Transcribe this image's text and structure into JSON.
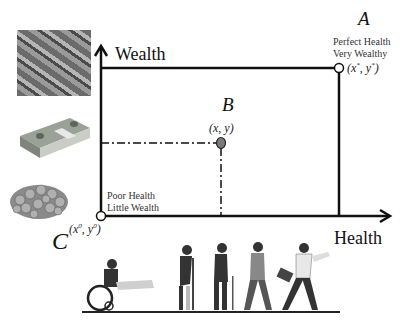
{
  "axes": {
    "y_label": "Wealth",
    "x_label": "Health"
  },
  "points": {
    "A": {
      "name": "A",
      "desc_line1": "Perfect Health",
      "desc_line2": "Very Wealthy",
      "coord": "(x*, y*)"
    },
    "B": {
      "name": "B",
      "coord": "(x, y)"
    },
    "C": {
      "name": "C",
      "desc_line1": "Poor Health",
      "desc_line2": "Little Wealth",
      "coord": "(x0, y0)"
    }
  },
  "images": {
    "top": "pile-of-cash",
    "middle": "stack-of-banknotes",
    "bottom": "pile-of-coins",
    "bottom_strip": "progression-from-wheelchair-to-running-businessman"
  },
  "colors": {
    "line": "#111111",
    "point_b_fill": "#7a7a7a",
    "open_point_fill": "#ffffff"
  }
}
